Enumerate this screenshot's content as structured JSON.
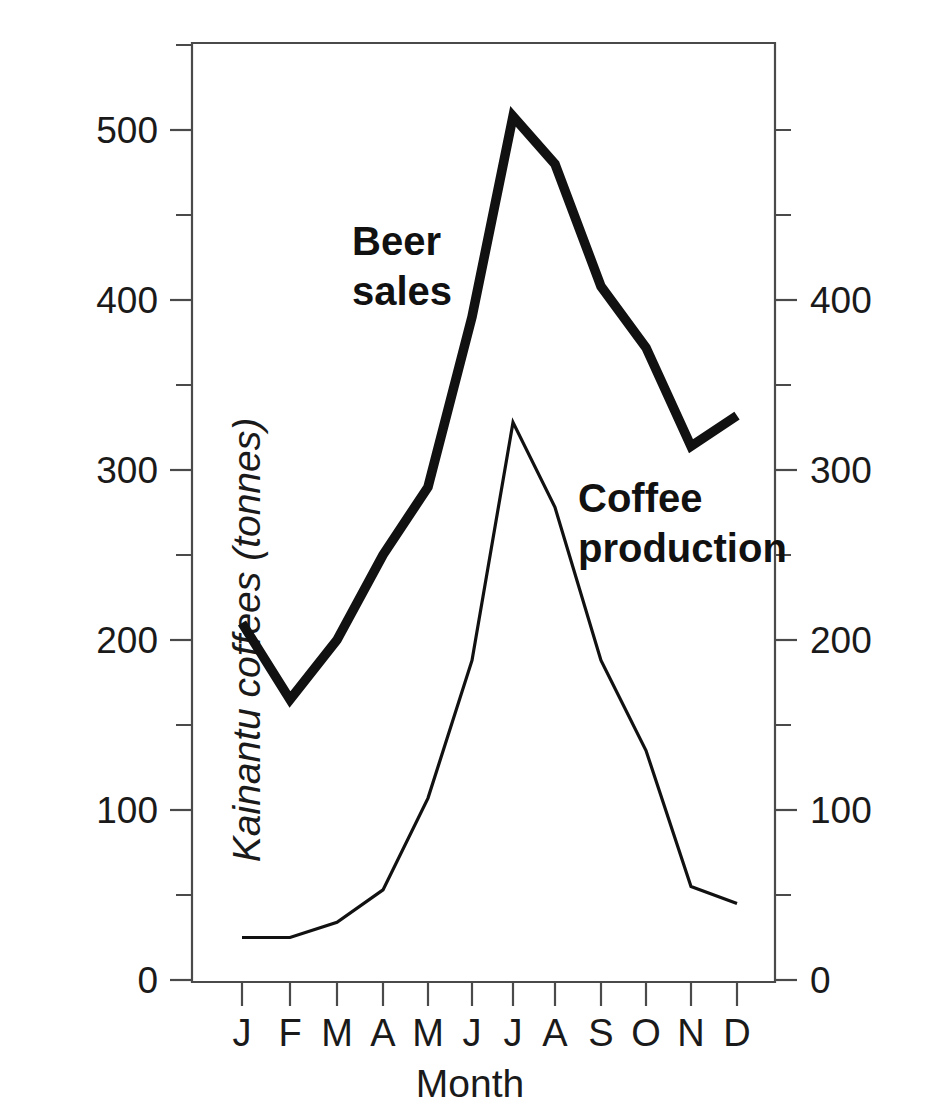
{
  "chart_data": {
    "type": "line",
    "title": "",
    "xlabel": "Month",
    "categories": [
      "J",
      "F",
      "M",
      "A",
      "M",
      "J",
      "J",
      "A",
      "S",
      "O",
      "N",
      "D"
    ],
    "grid": false,
    "legend_position": "inline-annotations",
    "series": [
      {
        "name": "Beer sales",
        "axis": "left",
        "style": "thick",
        "values": [
          210,
          165,
          200,
          250,
          290,
          390,
          508,
          480,
          408,
          372,
          314,
          332
        ]
      },
      {
        "name": "Coffee production",
        "axis": "right",
        "style": "thin",
        "values": [
          25,
          25,
          34,
          53,
          107,
          188,
          328,
          278,
          188,
          135,
          55,
          45
        ]
      }
    ],
    "left_axis": {
      "label": "Beer Sales (litres X 1000)",
      "unit": "litres X 1000",
      "ylim": [
        0,
        555
      ],
      "major_ticks": [
        0,
        100,
        200,
        300,
        400,
        500
      ],
      "minor_ticks": [
        50,
        150,
        250,
        350,
        450,
        550
      ],
      "tick_labels": [
        "0",
        "100",
        "200",
        "300",
        "400",
        "500"
      ]
    },
    "right_axis": {
      "label": "Kainantu coffees (tonnes)",
      "unit": "tonnes",
      "ylim": [
        0,
        555
      ],
      "major_ticks": [
        0,
        100,
        200,
        300,
        400
      ],
      "minor_ticks": [
        50,
        150,
        250,
        350,
        450,
        550
      ],
      "tick_labels": [
        "0",
        "100",
        "200",
        "300",
        "400"
      ]
    },
    "annotations": [
      {
        "id": "beer",
        "lines": [
          "Beer",
          "sales"
        ]
      },
      {
        "id": "coffee",
        "lines": [
          "Coffee",
          "production"
        ]
      }
    ]
  },
  "axes": {
    "x_title": "Month",
    "left_title": "Beer Sales (litres X 1000)",
    "right_title": "Kainantu coffees (tonnes)"
  },
  "annotations": {
    "beer_line1": "Beer",
    "beer_line2": "sales",
    "coffee_line1": "Coffee",
    "coffee_line2": "production"
  },
  "left_ticks": {
    "t0": "0",
    "t1": "100",
    "t2": "200",
    "t3": "300",
    "t4": "400",
    "t5": "500"
  },
  "right_ticks": {
    "t0": "0",
    "t1": "100",
    "t2": "200",
    "t3": "300",
    "t4": "400"
  },
  "months": {
    "m0": "J",
    "m1": "F",
    "m2": "M",
    "m3": "A",
    "m4": "M",
    "m5": "J",
    "m6": "J",
    "m7": "A",
    "m8": "S",
    "m9": "O",
    "m10": "N",
    "m11": "D"
  },
  "colors": {
    "line": "#111111",
    "axis": "#4a4a4a",
    "background": "#ffffff",
    "text": "#1a1a1a"
  }
}
